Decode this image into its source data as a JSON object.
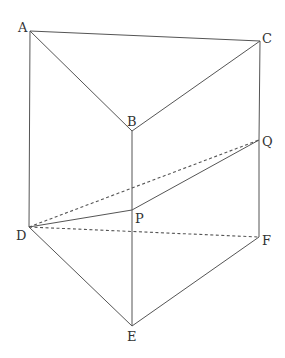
{
  "diagram": {
    "type": "triangular prism",
    "points": {
      "A": {
        "label": "A",
        "x": 30,
        "y": 31,
        "lx": 18,
        "ly": 32
      },
      "B": {
        "label": "B",
        "x": 132,
        "y": 131,
        "lx": 126,
        "ly": 126
      },
      "C": {
        "label": "C",
        "x": 260,
        "y": 41,
        "lx": 262,
        "ly": 42
      },
      "Q": {
        "label": "Q",
        "x": 259,
        "y": 140,
        "lx": 262,
        "ly": 145
      },
      "D": {
        "label": "D",
        "x": 29,
        "y": 227,
        "lx": 16,
        "ly": 240
      },
      "P": {
        "label": "P",
        "x": 132,
        "y": 210,
        "lx": 135,
        "ly": 222
      },
      "E": {
        "label": "E",
        "x": 132,
        "y": 326,
        "lx": 126,
        "ly": 341
      },
      "F": {
        "label": "F",
        "x": 259,
        "y": 237,
        "lx": 262,
        "ly": 244
      }
    },
    "solid_edges": [
      "AC",
      "AB",
      "BC",
      "AD",
      "BP",
      "PE",
      "CQ",
      "QF",
      "DE",
      "EF",
      "DP",
      "PQ"
    ],
    "dashed_edges": [
      "DQ",
      "DF"
    ],
    "colors": {
      "line": "#555555",
      "text": "#333333",
      "background": "#ffffff"
    }
  }
}
